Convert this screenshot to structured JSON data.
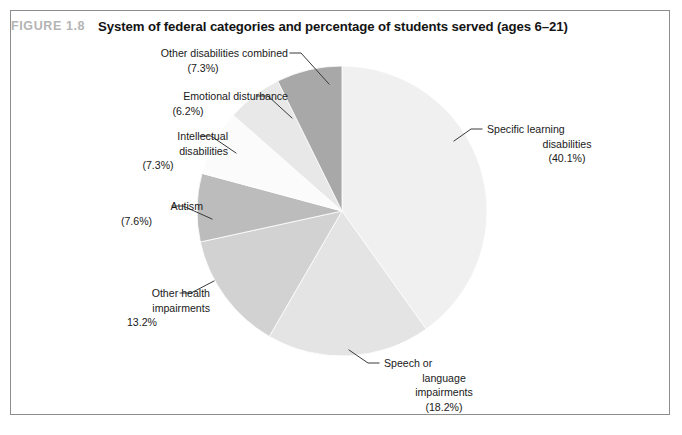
{
  "figure": {
    "number_label": "FIGURE 1.8",
    "title": "System of federal categories and percentage of students served (ages 6–21)"
  },
  "chart_data": {
    "type": "pie",
    "title": "System of federal categories and percentage of students served (ages 6–21)",
    "subtitle": "",
    "xlabel": "",
    "ylabel": "",
    "units": "percent",
    "start_angle_deg": 0,
    "direction": "clockwise",
    "legend_position": "none (external callout labels with leader lines)",
    "grid": false,
    "categories": [
      "Specific learning disabilities",
      "Speech or language impairments",
      "Other health impairments",
      "Autism",
      "Intellectual disabilities",
      "Emotional disturbance",
      "Other disabilities combined"
    ],
    "values": [
      40.1,
      18.2,
      13.2,
      7.6,
      7.3,
      6.2,
      7.3
    ],
    "colors": [
      "#f0f0f0",
      "#e4e4e4",
      "#d2d2d2",
      "#bcbcbc",
      "#fbfbfb",
      "#e8e8e8",
      "#a8a8a8"
    ],
    "slices": [
      {
        "label": "Specific learning disabilities",
        "value": 40.1,
        "display": "(40.1%)",
        "color": "#f0f0f0"
      },
      {
        "label": "Speech or language impairments",
        "value": 18.2,
        "display": "(18.2%)",
        "color": "#e4e4e4"
      },
      {
        "label": "Other health impairments",
        "value": 13.2,
        "display": "13.2%",
        "color": "#d2d2d2"
      },
      {
        "label": "Autism",
        "value": 7.6,
        "display": "(7.6%)",
        "color": "#bcbcbc"
      },
      {
        "label": "Intellectual disabilities",
        "value": 7.3,
        "display": "(7.3%)",
        "color": "#fbfbfb"
      },
      {
        "label": "Emotional disturbance",
        "value": 6.2,
        "display": "(6.2%)",
        "color": "#e8e8e8"
      },
      {
        "label": "Other disabilities combined",
        "value": 7.3,
        "display": "(7.3%)",
        "color": "#a8a8a8"
      }
    ]
  },
  "callouts": {
    "other_disabilities": {
      "line1": "Other disabilities combined",
      "line2": "(7.3%)"
    },
    "emotional": {
      "line1": "Emotional disturbance",
      "line2": "(6.2%)"
    },
    "intellectual": {
      "line1": "Intellectual",
      "line2": "disabilities",
      "line3": "(7.3%)"
    },
    "autism": {
      "line1": "Autism",
      "line2": "(7.6%)"
    },
    "other_health": {
      "line1": "Other health",
      "line2": "impairments",
      "line3": "13.2%"
    },
    "speech": {
      "line1": "Speech or",
      "line2": "language",
      "line3": "impairments",
      "line4": "(18.2%)"
    },
    "specific_learning": {
      "line1": "Specific learning",
      "line2": "disabilities",
      "line3": "(40.1%)"
    }
  }
}
